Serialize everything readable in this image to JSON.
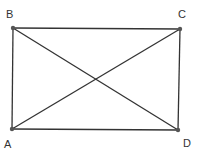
{
  "diagram": {
    "type": "rectangle-with-diagonals",
    "vertices": [
      {
        "id": "A",
        "label": "A"
      },
      {
        "id": "B",
        "label": "B"
      },
      {
        "id": "C",
        "label": "C"
      },
      {
        "id": "D",
        "label": "D"
      }
    ],
    "edges": [
      {
        "from": "B",
        "to": "C",
        "kind": "side"
      },
      {
        "from": "C",
        "to": "D",
        "kind": "side"
      },
      {
        "from": "D",
        "to": "A",
        "kind": "side"
      },
      {
        "from": "A",
        "to": "B",
        "kind": "side"
      },
      {
        "from": "A",
        "to": "C",
        "kind": "diagonal"
      },
      {
        "from": "B",
        "to": "D",
        "kind": "diagonal"
      }
    ],
    "colors": {
      "stroke": "#333333",
      "point": "#555555",
      "label": "#333333"
    }
  }
}
